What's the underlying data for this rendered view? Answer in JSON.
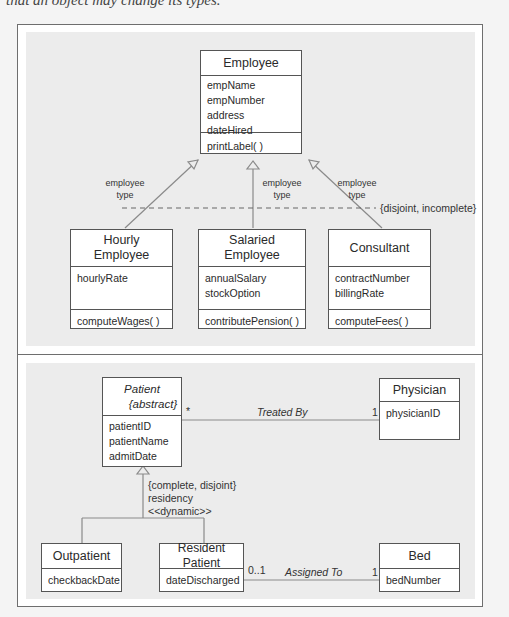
{
  "caption_fragment": "that an object may change its types.",
  "diagram_top": {
    "supertype": {
      "name": "Employee",
      "attributes": [
        "empName",
        "empNumber",
        "address",
        "dateHired"
      ],
      "operations": [
        "printLabel( )"
      ]
    },
    "discriminator_labels": [
      {
        "line1": "employee",
        "line2": "type"
      },
      {
        "line1": "employee",
        "line2": "type"
      },
      {
        "line1": "employee",
        "line2": "type"
      }
    ],
    "constraint": "{disjoint, incomplete}",
    "subtypes": [
      {
        "name_line1": "Hourly",
        "name_line2": "Employee",
        "attributes": [
          "hourlyRate"
        ],
        "operations": [
          "computeWages( )"
        ]
      },
      {
        "name_line1": "Salaried",
        "name_line2": "Employee",
        "attributes": [
          "annualSalary",
          "stockOption"
        ],
        "operations": [
          "contributePension( )"
        ]
      },
      {
        "name_line1": "Consultant",
        "attributes": [
          "contractNumber",
          "billingRate"
        ],
        "operations": [
          "computeFees( )"
        ]
      }
    ]
  },
  "diagram_bottom": {
    "patient": {
      "name": "Patient",
      "stereotype": "{abstract}",
      "attributes": [
        "patientID",
        "patientName",
        "admitDate"
      ]
    },
    "physician": {
      "name": "Physician",
      "attributes": [
        "physicianID"
      ]
    },
    "treated_by": {
      "label": "Treated By",
      "mult_patient": "*",
      "mult_physician": "1"
    },
    "generalization": {
      "constraint": "{complete, disjoint}",
      "discriminator": "residency",
      "stereotype": "<<dynamic>>"
    },
    "outpatient": {
      "name": "Outpatient",
      "attributes": [
        "checkbackDate"
      ]
    },
    "resident": {
      "name": "Resident Patient",
      "attributes": [
        "dateDischarged"
      ]
    },
    "bed": {
      "name": "Bed",
      "attributes": [
        "bedNumber"
      ]
    },
    "assigned_to": {
      "label": "Assigned To",
      "mult_resident": "0..1",
      "mult_bed": "1"
    }
  }
}
